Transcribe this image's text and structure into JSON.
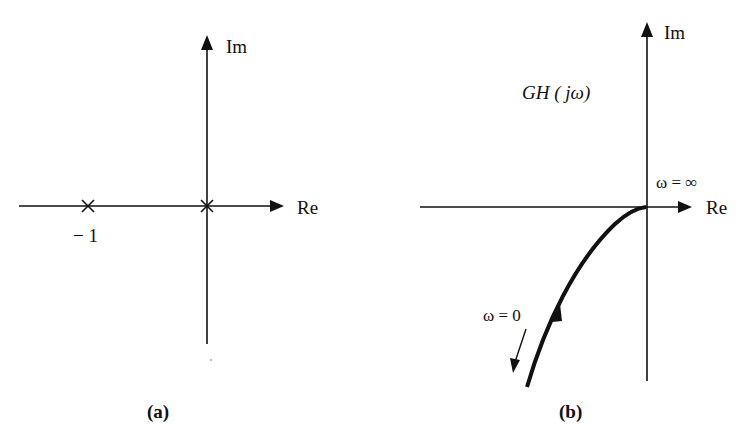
{
  "panels": [
    {
      "id": "a",
      "caption": "(a)",
      "title": "Pole locations",
      "axis_labels": {
        "real": "Re",
        "imag": "Im"
      },
      "poles": [
        {
          "re": -1,
          "im": 0,
          "marker": "×",
          "label": "− 1"
        },
        {
          "re": 0,
          "im": 0,
          "marker": "×",
          "label": ""
        }
      ]
    },
    {
      "id": "b",
      "caption": "(b)",
      "axis_labels": {
        "real": "Re",
        "imag": "Im"
      },
      "function_label": "GH ( jω)",
      "annotations": {
        "omega_inf": "ω = ∞",
        "omega_zero": "ω = 0"
      },
      "curve_description": "Polar plot approaching origin tangentially from third quadrant as ω → ∞"
    }
  ],
  "colors": {
    "ink": "#111111",
    "background": "#ffffff"
  }
}
